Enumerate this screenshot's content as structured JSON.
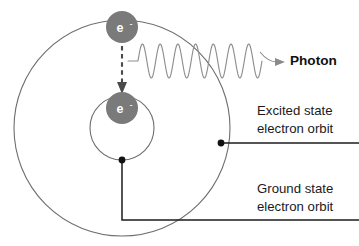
{
  "figure": {
    "background_color": "#ffffff"
  },
  "electrons": [
    {
      "id": "excited-electron",
      "symbol": "e",
      "charge": "-",
      "state": "excited",
      "cx": 122,
      "cy": 27,
      "r": 16,
      "fill": "#7a7a7a",
      "text_color": "#ffffff"
    },
    {
      "id": "ground-electron",
      "symbol": "e",
      "charge": "-",
      "state": "ground",
      "cx": 122,
      "cy": 108,
      "r": 16,
      "fill": "#7a7a7a",
      "text_color": "#ffffff"
    }
  ],
  "orbits": [
    {
      "id": "excited-orbit",
      "label_key": "excited_state",
      "cx": 122,
      "cy": 128,
      "r": 108,
      "stroke": "#6e6e6e"
    },
    {
      "id": "ground-orbit",
      "label_key": "ground_state",
      "cx": 122,
      "cy": 128,
      "r": 32,
      "stroke": "#6e6e6e"
    }
  ],
  "transition": {
    "name": "electron-transition-arrow",
    "from_y": 46,
    "to_y": 90,
    "x": 122,
    "style": "dashed",
    "color": "#4a4a4a"
  },
  "photon": {
    "label": "Photon",
    "label_x": 290,
    "label_y": 65,
    "wave_color": "#8e8e8e",
    "wave_start_x": 128,
    "wave_end_x": 262,
    "wave_baseline_y": 61,
    "wave_amplitude": 17,
    "wave_cycles": 7
  },
  "labels": {
    "excited_state": {
      "line1": "Excited state",
      "line2": "electron orbit",
      "text_x": 257,
      "line1_y": 115,
      "line2_y": 133,
      "leader_dot_x": 221,
      "leader_dot_y": 143,
      "leader_end_x": 359
    },
    "ground_state": {
      "line1": "Ground state",
      "line2": "electron orbit",
      "text_x": 257,
      "line1_y": 193,
      "line2_y": 211,
      "leader_start_x": 122,
      "leader_start_y": 160,
      "leader_corner_y": 220,
      "leader_end_x": 359
    }
  },
  "colors": {
    "electron_fill": "#7a7a7a",
    "orbit_stroke": "#6e6e6e",
    "wave_stroke": "#8e8e8e",
    "leader_stroke": "#1d1d1d",
    "text": "#1a1a1a",
    "background": "#ffffff"
  }
}
